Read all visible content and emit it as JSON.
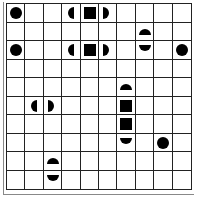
{
  "board": {
    "rows": 10,
    "cols": 10,
    "pieces": [
      {
        "row": 0,
        "col": 0,
        "shape": "circle"
      },
      {
        "row": 0,
        "col": 3,
        "shape": "half-left"
      },
      {
        "row": 0,
        "col": 4,
        "shape": "square"
      },
      {
        "row": 0,
        "col": 5,
        "shape": "half-right"
      },
      {
        "row": 1,
        "col": 7,
        "shape": "half-top"
      },
      {
        "row": 2,
        "col": 0,
        "shape": "circle"
      },
      {
        "row": 2,
        "col": 3,
        "shape": "half-left"
      },
      {
        "row": 2,
        "col": 4,
        "shape": "square"
      },
      {
        "row": 2,
        "col": 5,
        "shape": "half-right"
      },
      {
        "row": 2,
        "col": 7,
        "shape": "half-bottom"
      },
      {
        "row": 2,
        "col": 9,
        "shape": "circle"
      },
      {
        "row": 4,
        "col": 6,
        "shape": "half-top"
      },
      {
        "row": 5,
        "col": 1,
        "shape": "half-left"
      },
      {
        "row": 5,
        "col": 2,
        "shape": "half-right"
      },
      {
        "row": 5,
        "col": 6,
        "shape": "square"
      },
      {
        "row": 6,
        "col": 6,
        "shape": "square"
      },
      {
        "row": 7,
        "col": 6,
        "shape": "half-bottom"
      },
      {
        "row": 7,
        "col": 8,
        "shape": "circle"
      },
      {
        "row": 8,
        "col": 2,
        "shape": "half-top"
      },
      {
        "row": 9,
        "col": 2,
        "shape": "half-bottom"
      }
    ],
    "colors": {
      "piece": "#000000",
      "grid": "#222222",
      "background": "#ffffff"
    }
  }
}
